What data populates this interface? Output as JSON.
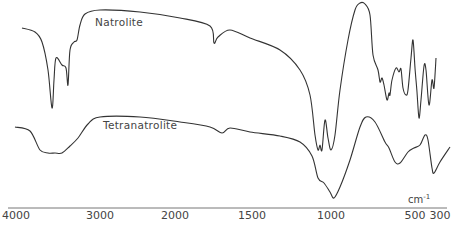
{
  "chart_data": {
    "type": "line",
    "title": "",
    "xlabel": "cm-1",
    "ylabel": "",
    "x_axis": {
      "reversed": true,
      "nonlinear_scale": true,
      "tick_labels": [
        "4000",
        "3000",
        "2000",
        "1500",
        "1000",
        "500",
        "300"
      ],
      "range": [
        4000,
        300
      ]
    },
    "grid": false,
    "legend": "inline labels",
    "series": [
      {
        "name": "Natrolite",
        "description": "IR transmission spectrum, upper trace",
        "notable_bands_cm-1": [
          3540,
          3330,
          3230,
          1630,
          1100,
          1040,
          970,
          720,
          690,
          660,
          620,
          590,
          540,
          470,
          430,
          380,
          330
        ],
        "points_px": [
          [
            22,
            28
          ],
          [
            35,
            32
          ],
          [
            42,
            42
          ],
          [
            48,
            70
          ],
          [
            52,
            108
          ],
          [
            54,
            80
          ],
          [
            56,
            58
          ],
          [
            62,
            65
          ],
          [
            66,
            68
          ],
          [
            68,
            85
          ],
          [
            70,
            50
          ],
          [
            74,
            42
          ],
          [
            77,
            40
          ],
          [
            80,
            25
          ],
          [
            85,
            14
          ],
          [
            100,
            10
          ],
          [
            140,
            12
          ],
          [
            180,
            18
          ],
          [
            210,
            26
          ],
          [
            214,
            43
          ],
          [
            218,
            37
          ],
          [
            230,
            30
          ],
          [
            250,
            38
          ],
          [
            280,
            50
          ],
          [
            300,
            70
          ],
          [
            310,
            95
          ],
          [
            315,
            135
          ],
          [
            318,
            150
          ],
          [
            320,
            145
          ],
          [
            322,
            150
          ],
          [
            325,
            120
          ],
          [
            328,
            138
          ],
          [
            331,
            150
          ],
          [
            335,
            135
          ],
          [
            340,
            90
          ],
          [
            348,
            40
          ],
          [
            355,
            10
          ],
          [
            360,
            3
          ],
          [
            365,
            4
          ],
          [
            370,
            15
          ],
          [
            373,
            55
          ],
          [
            378,
            70
          ],
          [
            380,
            82
          ],
          [
            382,
            78
          ],
          [
            384,
            85
          ],
          [
            387,
            100
          ],
          [
            389,
            93
          ],
          [
            390,
            95
          ],
          [
            392,
            80
          ],
          [
            396,
            68
          ],
          [
            399,
            72
          ],
          [
            401,
            69
          ],
          [
            403,
            88
          ],
          [
            406,
            95
          ],
          [
            408,
            90
          ],
          [
            411,
            58
          ],
          [
            413,
            40
          ],
          [
            415,
            68
          ],
          [
            417,
            92
          ],
          [
            419,
            118
          ],
          [
            421,
            100
          ],
          [
            424,
            66
          ],
          [
            426,
            70
          ],
          [
            429,
            105
          ],
          [
            432,
            80
          ],
          [
            434,
            88
          ],
          [
            436,
            58
          ]
        ]
      },
      {
        "name": "Tetranatrolite",
        "description": "IR transmission spectrum, lower trace",
        "notable_bands_cm-1": [
          3500,
          3380,
          1640,
          1080,
          990,
          690,
          590,
          480
        ],
        "points_px": [
          [
            15,
            127
          ],
          [
            30,
            131
          ],
          [
            40,
            150
          ],
          [
            48,
            153
          ],
          [
            55,
            153
          ],
          [
            62,
            153
          ],
          [
            70,
            146
          ],
          [
            78,
            138
          ],
          [
            88,
            124
          ],
          [
            100,
            117
          ],
          [
            140,
            117
          ],
          [
            180,
            122
          ],
          [
            210,
            127
          ],
          [
            222,
            133
          ],
          [
            230,
            128
          ],
          [
            250,
            132
          ],
          [
            280,
            136
          ],
          [
            300,
            142
          ],
          [
            312,
            156
          ],
          [
            318,
            178
          ],
          [
            324,
            183
          ],
          [
            330,
            192
          ],
          [
            334,
            198
          ],
          [
            340,
            187
          ],
          [
            350,
            160
          ],
          [
            360,
            127
          ],
          [
            366,
            117
          ],
          [
            375,
            122
          ],
          [
            385,
            142
          ],
          [
            389,
            148
          ],
          [
            395,
            162
          ],
          [
            400,
            163
          ],
          [
            408,
            152
          ],
          [
            414,
            148
          ],
          [
            420,
            145
          ],
          [
            425,
            135
          ],
          [
            428,
            140
          ],
          [
            432,
            168
          ],
          [
            434,
            173
          ],
          [
            440,
            162
          ],
          [
            450,
            147
          ]
        ]
      }
    ],
    "annotations": [
      {
        "text": "Natrolite",
        "x_px": 95,
        "y_px": 16
      },
      {
        "text": "Tetranatrolite",
        "x_px": 103,
        "y_px": 120
      },
      {
        "text": "cm-1",
        "x_px": 408,
        "y_px": 193
      }
    ]
  },
  "axis": {
    "ticks": [
      {
        "label": "4000",
        "x": 16
      },
      {
        "label": "3000",
        "x": 100
      },
      {
        "label": "2000",
        "x": 175
      },
      {
        "label": "1500",
        "x": 252
      },
      {
        "label": "1000",
        "x": 331
      },
      {
        "label": "500",
        "x": 415
      },
      {
        "label": "300",
        "x": 440
      }
    ],
    "unit": "cm",
    "unit_exp": "-1"
  },
  "labels": {
    "natrolite": "Natrolite",
    "tetranatrolite": "Tetranatrolite"
  },
  "colors": {
    "line": "#333333",
    "text": "#444444",
    "axis": "#666666"
  }
}
